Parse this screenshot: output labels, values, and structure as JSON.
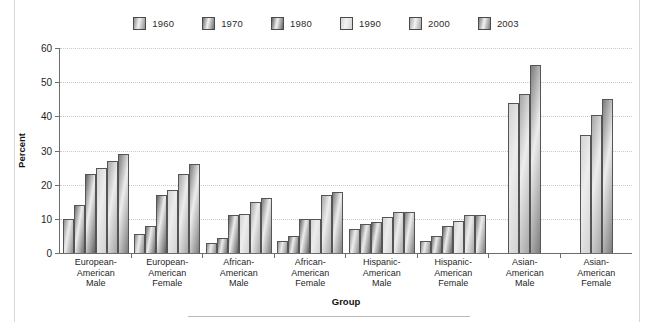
{
  "chart_data": {
    "type": "bar",
    "title": "",
    "xlabel": "Group",
    "ylabel": "Percent",
    "ylim": [
      0,
      60
    ],
    "yticks": [
      0,
      10,
      20,
      30,
      40,
      50,
      60
    ],
    "grid": true,
    "legend_position": "top-center",
    "categories": [
      "European-American Male",
      "European-American Female",
      "African-American Male",
      "African-American Female",
      "Hispanic-American Male",
      "Hispanic-American Female",
      "Asian-American Male",
      "Asian-American Female"
    ],
    "category_lines": [
      [
        "European-",
        "American",
        "Male"
      ],
      [
        "European-",
        "American",
        "Female"
      ],
      [
        "African-",
        "American",
        "Male"
      ],
      [
        "African-",
        "American",
        "Female"
      ],
      [
        "Hispanic-",
        "American",
        "Male"
      ],
      [
        "Hispanic-",
        "American",
        "Female"
      ],
      [
        "Asian-",
        "American",
        "Male"
      ],
      [
        "Asian-",
        "American",
        "Female"
      ]
    ],
    "series": [
      {
        "name": "1960",
        "color": "#8e8e8e",
        "values": [
          10,
          5.5,
          3,
          3.5,
          7,
          3.5,
          null,
          null
        ]
      },
      {
        "name": "1970",
        "color": "#6f6f6f",
        "values": [
          14,
          8,
          4.5,
          5,
          8.5,
          5,
          null,
          null
        ]
      },
      {
        "name": "1980",
        "color": "#636363",
        "values": [
          23,
          17,
          11,
          10,
          9,
          8,
          null,
          null
        ]
      },
      {
        "name": "1990",
        "color": "#d2d2d2",
        "values": [
          25,
          18.5,
          11.5,
          10,
          10.5,
          9.5,
          44,
          34.5
        ]
      },
      {
        "name": "2000",
        "color": "#a6a6a6",
        "values": [
          27,
          23,
          15,
          17,
          12,
          11,
          46.5,
          40.5
        ]
      },
      {
        "name": "2003",
        "color": "#7d7d7d",
        "values": [
          29,
          26,
          16,
          18,
          12,
          11,
          55,
          45
        ]
      }
    ]
  },
  "legend": {
    "items": [
      {
        "label": "1960"
      },
      {
        "label": "1970"
      },
      {
        "label": "1980"
      },
      {
        "label": "1990"
      },
      {
        "label": "2000"
      },
      {
        "label": "2003"
      }
    ]
  }
}
